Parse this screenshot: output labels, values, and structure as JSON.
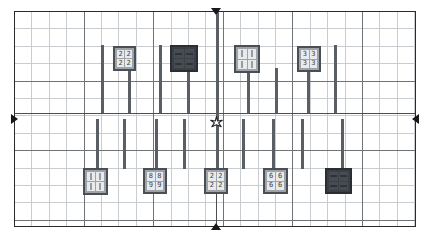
{
  "figure": {
    "type": "technical-layout-diagram",
    "background_color": "#ffffff",
    "frame_color": "#2b2b2b",
    "grid_minor_color": "#c9ccd1",
    "grid_major_color": "#6e7378",
    "pole_color": "#5a5f66",
    "marker_color": "#15181c"
  },
  "plot_area": {
    "x": 14,
    "y": 11,
    "width": 402,
    "height": 216,
    "minor_step_x": 17.4,
    "minor_step_y": 17.4,
    "major_step_x": 69.6,
    "major_step_y": 69.6
  },
  "axes": {
    "horizontal_axis_y": 113,
    "vertical_axis_x": 216
  },
  "edge_markers": [
    {
      "name": "top-marker",
      "direction": "down",
      "x": 216,
      "y": 11
    },
    {
      "name": "bottom-marker",
      "direction": "up",
      "x": 216,
      "y": 227
    },
    {
      "name": "left-marker",
      "direction": "right",
      "x": 14,
      "y": 119
    },
    {
      "name": "right-marker",
      "direction": "left",
      "x": 416,
      "y": 119
    }
  ],
  "origin_marker": {
    "name": "origin-star",
    "x": 216,
    "y": 120,
    "glyph": "star"
  },
  "poles": [
    {
      "x": 101,
      "top": 45,
      "height": 68
    },
    {
      "x": 128,
      "top": 68,
      "height": 45
    },
    {
      "x": 159,
      "top": 45,
      "height": 68
    },
    {
      "x": 187,
      "top": 68,
      "height": 45
    },
    {
      "x": 216,
      "top": 11,
      "height": 110
    },
    {
      "x": 247,
      "top": 45,
      "height": 68
    },
    {
      "x": 275,
      "top": 68,
      "height": 45
    },
    {
      "x": 307,
      "top": 68,
      "height": 45
    },
    {
      "x": 334,
      "top": 45,
      "height": 68
    },
    {
      "x": 96,
      "top": 119,
      "height": 50
    },
    {
      "x": 123,
      "top": 119,
      "height": 50
    },
    {
      "x": 155,
      "top": 119,
      "height": 50
    },
    {
      "x": 183,
      "top": 119,
      "height": 50
    },
    {
      "x": 216,
      "top": 119,
      "height": 50
    },
    {
      "x": 242,
      "top": 119,
      "height": 50
    },
    {
      "x": 272,
      "top": 119,
      "height": 50
    },
    {
      "x": 301,
      "top": 119,
      "height": 50
    },
    {
      "x": 341,
      "top": 119,
      "height": 50
    }
  ],
  "signs": [
    {
      "name": "sign-top-1",
      "style": "light",
      "x": 113,
      "y": 46,
      "width": 23,
      "height": 25,
      "cells": [
        "2",
        "2",
        "2",
        "2"
      ]
    },
    {
      "name": "sign-top-2",
      "style": "dark",
      "x": 170,
      "y": 45,
      "width": 28,
      "height": 27,
      "cells": [
        "",
        "",
        "",
        ""
      ]
    },
    {
      "name": "sign-top-3",
      "style": "light",
      "x": 234,
      "y": 45,
      "width": 26,
      "height": 28,
      "cells": [
        "|",
        "|",
        "|",
        "|"
      ]
    },
    {
      "name": "sign-top-4",
      "style": "light",
      "x": 297,
      "y": 46,
      "width": 24,
      "height": 26,
      "cells": [
        "3",
        "3",
        "3",
        "3"
      ]
    },
    {
      "name": "sign-bottom-1",
      "style": "light",
      "x": 83,
      "y": 168,
      "width": 25,
      "height": 27,
      "cells": [
        "|",
        "|",
        "|",
        "|"
      ]
    },
    {
      "name": "sign-bottom-2",
      "style": "light",
      "x": 143,
      "y": 168,
      "width": 24,
      "height": 26,
      "cells": [
        "8",
        "8",
        "9",
        "9"
      ]
    },
    {
      "name": "sign-bottom-3",
      "style": "light",
      "x": 204,
      "y": 168,
      "width": 24,
      "height": 26,
      "cells": [
        "2",
        "2",
        "2",
        "2"
      ]
    },
    {
      "name": "sign-bottom-4",
      "style": "light",
      "x": 263,
      "y": 168,
      "width": 25,
      "height": 26,
      "cells": [
        "6",
        "6",
        "6",
        "6"
      ]
    },
    {
      "name": "sign-bottom-5",
      "style": "dark",
      "x": 325,
      "y": 168,
      "width": 27,
      "height": 26,
      "cells": [
        "",
        "",
        "",
        ""
      ]
    }
  ]
}
